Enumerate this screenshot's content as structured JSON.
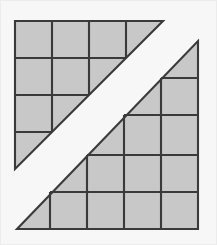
{
  "figure": {
    "background_color": "#f7f7f7",
    "frame_color": "#ececec",
    "canvas": {
      "width": 217,
      "height": 245
    }
  },
  "style": {
    "fill_color": "#c8c8c8",
    "line_color": "#3a3a3a",
    "gap_color": "#ffffff",
    "stroke_width": 2.1
  },
  "chart_data": {
    "type": "diagram",
    "subtitle": "",
    "xlabel": "",
    "ylabel": "",
    "grid": true,
    "legend": "none",
    "cell_size": 37,
    "shapes": [
      {
        "name": "upper-left-staircase-triangle",
        "orientation": "hypotenuse-descends-left",
        "origin": {
          "x": 15,
          "y": 21
        },
        "columns": 4,
        "rows": 4,
        "square_count": 6,
        "half_square_count": 4,
        "outline_points": "15,21 163,21 15,169",
        "x_gridlines": [
          15,
          52,
          89,
          126,
          163
        ],
        "y_gridlines": [
          21,
          58,
          95,
          132,
          169
        ],
        "full_squares": [
          {
            "col": 0,
            "row": 0
          },
          {
            "col": 1,
            "row": 0
          },
          {
            "col": 2,
            "row": 0
          },
          {
            "col": 0,
            "row": 1
          },
          {
            "col": 1,
            "row": 1
          },
          {
            "col": 0,
            "row": 2
          }
        ],
        "diagonal_half_squares": [
          {
            "col": 3,
            "row": 0
          },
          {
            "col": 2,
            "row": 1
          },
          {
            "col": 1,
            "row": 2
          },
          {
            "col": 0,
            "row": 3
          }
        ]
      },
      {
        "name": "lower-right-staircase-triangle",
        "orientation": "hypotenuse-descends-left",
        "origin": {
          "x": 50,
          "y": 81
        },
        "columns": 4,
        "rows": 4,
        "square_count": 6,
        "half_square_count": 4,
        "outline_points": "198,41 198,229 17,229",
        "x_gridlines": [
          50,
          87,
          124,
          161,
          198
        ],
        "y_gridlines": [
          41,
          78,
          115,
          155,
          192,
          229
        ],
        "full_squares": [
          {
            "col": 3,
            "row": 1
          },
          {
            "col": 2,
            "row": 2
          },
          {
            "col": 3,
            "row": 2
          },
          {
            "col": 1,
            "row": 3
          },
          {
            "col": 2,
            "row": 3
          },
          {
            "col": 3,
            "row": 3
          }
        ],
        "diagonal_half_squares": [
          {
            "col": 3,
            "row": 0
          },
          {
            "col": 2,
            "row": 1
          },
          {
            "col": 1,
            "row": 2
          },
          {
            "col": 0,
            "row": 3
          }
        ]
      }
    ],
    "annotations": []
  }
}
